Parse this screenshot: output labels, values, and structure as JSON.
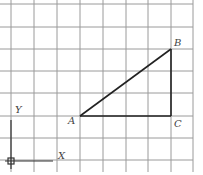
{
  "diagram": {
    "grid": {
      "x_lines": [
        11,
        34,
        57,
        80,
        103,
        126,
        148,
        171,
        193
      ],
      "y_lines": [
        4,
        27,
        49,
        71,
        93,
        116,
        138,
        160
      ],
      "color": "#9a9a9a"
    },
    "points": {
      "A": {
        "label": "A",
        "x": 80,
        "y": 116
      },
      "B": {
        "label": "B",
        "x": 171,
        "y": 49
      },
      "C": {
        "label": "C",
        "x": 171,
        "y": 116
      }
    },
    "axes": {
      "x_label": "X",
      "y_label": "Y"
    },
    "line_color": "#222222"
  }
}
